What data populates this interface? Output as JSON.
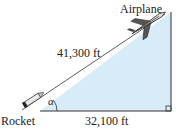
{
  "diagram": {
    "type": "right-triangle",
    "labels": {
      "airplane": "Airplane",
      "rocket": "Rocket",
      "hypotenuse": "41,300 ft",
      "base": "32,100 ft",
      "angle": "α"
    },
    "colors": {
      "fill": "#d8ecf8",
      "stroke": "#333333"
    }
  }
}
